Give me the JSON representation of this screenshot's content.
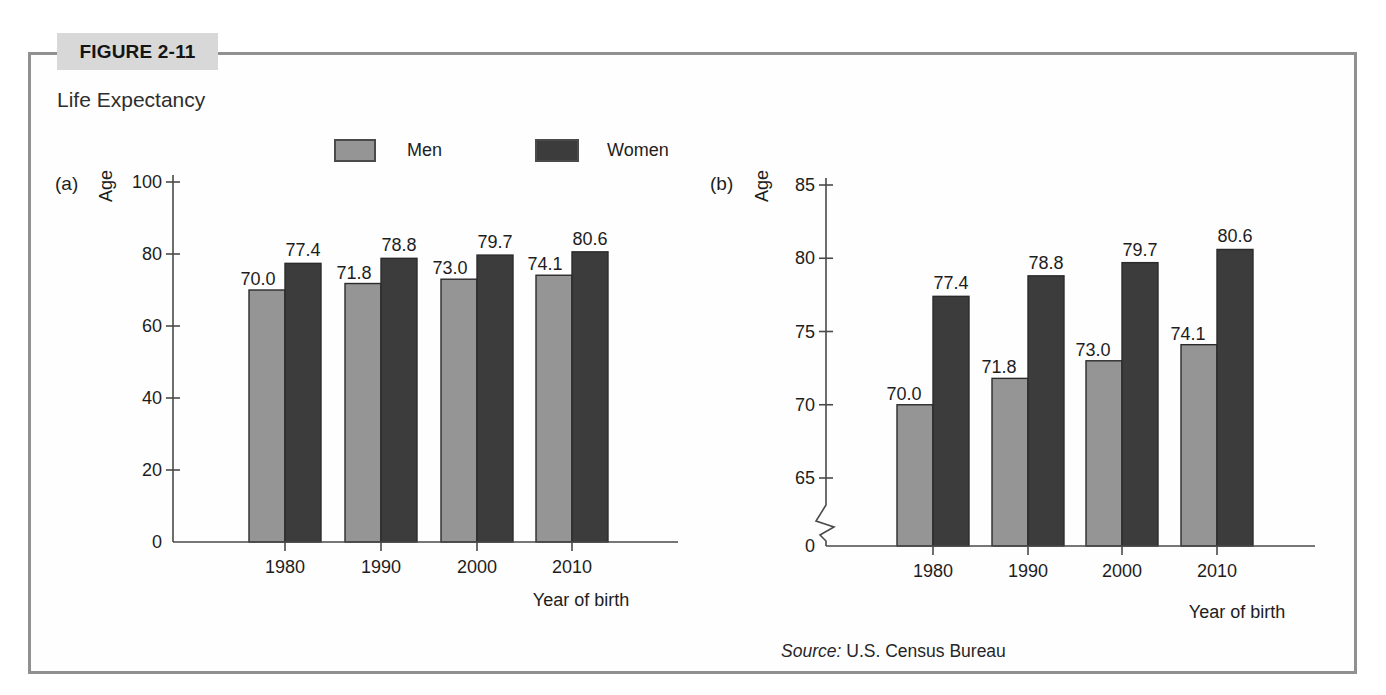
{
  "header": {
    "figure_label": "FIGURE 2-11",
    "title": "Life Expectancy"
  },
  "source": {
    "prefix": "Source:",
    "text": "U.S. Census Bureau"
  },
  "colors": {
    "men_bar": "#959595",
    "women_bar": "#3c3c3c",
    "bar_outline": "#2b2b2b",
    "axis": "#4a4a4a",
    "frame_border": "#909090",
    "figure_label_bg": "#d8d8d8"
  },
  "chart_data": [
    {
      "id": "a",
      "panel_label": "(a)",
      "type": "bar",
      "ylabel": "Age",
      "xlabel": "Year of birth",
      "categories": [
        "1980",
        "1990",
        "2000",
        "2010"
      ],
      "series": [
        {
          "name": "Men",
          "color": "#959595",
          "values": [
            70.0,
            71.8,
            73.0,
            74.1
          ]
        },
        {
          "name": "Women",
          "color": "#3c3c3c",
          "values": [
            77.4,
            78.8,
            79.7,
            80.6
          ]
        }
      ],
      "ylim": [
        0,
        100
      ],
      "yticks": [
        20,
        40,
        60,
        80,
        100
      ],
      "origin_label": "0",
      "axis_break": false,
      "value_label_decimals": 1,
      "grid": false,
      "legend_position": "top-shared"
    },
    {
      "id": "b",
      "panel_label": "(b)",
      "type": "bar",
      "ylabel": "Age",
      "xlabel": "Year of birth",
      "categories": [
        "1980",
        "1990",
        "2000",
        "2010"
      ],
      "series": [
        {
          "name": "Men",
          "color": "#959595",
          "values": [
            70.0,
            71.8,
            73.0,
            74.1
          ]
        },
        {
          "name": "Women",
          "color": "#3c3c3c",
          "values": [
            77.4,
            78.8,
            79.7,
            80.6
          ]
        }
      ],
      "ylim": [
        65,
        85
      ],
      "yticks": [
        65,
        70,
        75,
        80,
        85
      ],
      "origin_label": "0",
      "axis_break": true,
      "value_label_decimals": 1,
      "grid": false,
      "legend_position": "top-shared"
    }
  ]
}
